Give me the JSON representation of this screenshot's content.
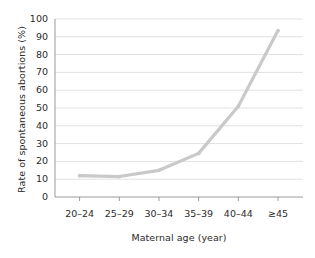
{
  "chart_data": {
    "type": "line",
    "title": "",
    "subtitle": "",
    "xlabel": "Maternal age (year)",
    "ylabel": "Rate of spontaneous abortions (%)",
    "categories": [
      "20–24",
      "25–29",
      "30–34",
      "35–39",
      "40–44",
      "≥45"
    ],
    "values": [
      12,
      11.5,
      15,
      24.5,
      51,
      93.5
    ],
    "series": [
      {
        "name": "Rate of spontaneous abortions",
        "values": [
          12,
          11.5,
          15,
          24.5,
          51,
          93.5
        ]
      }
    ],
    "ylim": [
      0,
      100
    ],
    "ytick_labels": [
      "0",
      "10",
      "20",
      "30",
      "40",
      "50",
      "60",
      "70",
      "80",
      "90",
      "100"
    ],
    "ytick_values": [
      0,
      10,
      20,
      30,
      40,
      50,
      60,
      70,
      80,
      90,
      100
    ],
    "grid": "horizontal",
    "legend": "none",
    "annotations": [],
    "colors": {
      "line": "#c9c9c9",
      "marker": "#c9c9c9",
      "grid": "#e2e2e2",
      "axis": "#9a9a9a",
      "text": "#2b2b2b",
      "background": "#ffffff"
    }
  }
}
